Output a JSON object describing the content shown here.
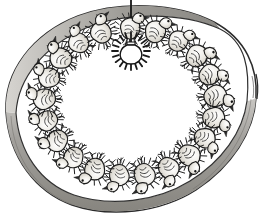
{
  "figure": {
    "title": "Chicks ringed under a hanging heat lamp inside a circular brooder guard",
    "medium": "pen-and-ink line drawing with graphite shading",
    "width": 261,
    "height": 223,
    "background_color": "#ffffff",
    "ink_color": "#1a1a1a",
    "shade_color": "#8f8f8f",
    "chick_fill_color": "#e3dfd8"
  },
  "brooder_guard": {
    "name": "circular brooder guard wall",
    "outer_outline_color": "#262626",
    "band_fill_color": "#9a9a9a",
    "band_highlight_color": "#d8d6d2",
    "floor_fill_color": "#ffffff",
    "wall_overlap_mark": "short tick at right edge where guard ring ends overlap",
    "center": {
      "x": 130,
      "y": 104
    },
    "outer_radius_x": 128,
    "outer_radius_y": 104
  },
  "heat_lamp": {
    "name": "hanging heat lamp",
    "cord": {
      "label": "suspension cord",
      "color": "#1a1a1a",
      "x": 131,
      "y_top": 0,
      "y_bottom": 42,
      "width": 1.8
    },
    "bulb": {
      "label": "light bulb",
      "center_x": 131,
      "center_y": 51,
      "radius": 9,
      "outline_color": "#1a1a1a",
      "fill_color": "#ffffff"
    },
    "rays": {
      "label": "radiating heat and light rays",
      "count": 20,
      "color": "#1a1a1a",
      "inner_radius": 13,
      "outer_radius": 19
    }
  },
  "chick_ring": {
    "name": "ring of chicks facing the lamp",
    "count": 21,
    "center": {
      "x": 130,
      "y": 102
    },
    "radius_x": 86,
    "radius_y": 74,
    "note": "chicks huddle in an even circle under the lamp, heads turned inward",
    "chicks": [
      {
        "id": 1,
        "angle_deg": -90,
        "size": 1.0,
        "tilt": 2
      },
      {
        "id": 2,
        "angle_deg": -73,
        "size": 1.04,
        "tilt": 14
      },
      {
        "id": 3,
        "angle_deg": -56,
        "size": 0.98,
        "tilt": 26
      },
      {
        "id": 4,
        "angle_deg": -39,
        "size": 1.06,
        "tilt": 40
      },
      {
        "id": 5,
        "angle_deg": -22,
        "size": 1.02,
        "tilt": 56
      },
      {
        "id": 6,
        "angle_deg": -5,
        "size": 1.08,
        "tilt": 72
      },
      {
        "id": 7,
        "angle_deg": 12,
        "size": 1.04,
        "tilt": 88
      },
      {
        "id": 8,
        "angle_deg": 29,
        "size": 1.0,
        "tilt": 104
      },
      {
        "id": 9,
        "angle_deg": 46,
        "size": 1.06,
        "tilt": 122
      },
      {
        "id": 10,
        "angle_deg": 63,
        "size": 1.02,
        "tilt": 138
      },
      {
        "id": 11,
        "angle_deg": 80,
        "size": 1.05,
        "tilt": 154
      },
      {
        "id": 12,
        "angle_deg": 97,
        "size": 1.0,
        "tilt": 172
      },
      {
        "id": 13,
        "angle_deg": 114,
        "size": 1.03,
        "tilt": 190
      },
      {
        "id": 14,
        "angle_deg": 131,
        "size": 0.99,
        "tilt": 206
      },
      {
        "id": 15,
        "angle_deg": 148,
        "size": 1.04,
        "tilt": 222
      },
      {
        "id": 16,
        "angle_deg": 165,
        "size": 1.0,
        "tilt": 240
      },
      {
        "id": 17,
        "angle_deg": 182,
        "size": 1.05,
        "tilt": 256
      },
      {
        "id": 18,
        "angle_deg": 199,
        "size": 1.01,
        "tilt": 272
      },
      {
        "id": 19,
        "angle_deg": 216,
        "size": 1.04,
        "tilt": 288
      },
      {
        "id": 20,
        "angle_deg": 233,
        "size": 0.98,
        "tilt": 305
      },
      {
        "id": 21,
        "angle_deg": 250,
        "size": 1.02,
        "tilt": 322
      }
    ]
  },
  "floor": {
    "name": "brooder floor",
    "fill_color": "#ffffff",
    "inner_rim_color": "#3a3a3a"
  }
}
